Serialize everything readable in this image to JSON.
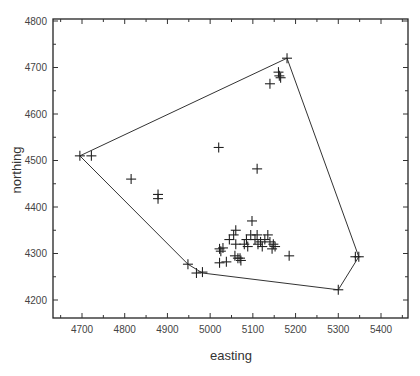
{
  "chart_data": {
    "type": "scatter",
    "title": "",
    "xlabel": "easting",
    "ylabel": "northing",
    "xlim": [
      4640,
      5460
    ],
    "ylim": [
      4150,
      4810
    ],
    "xticks": [
      4700,
      4800,
      4900,
      5000,
      5100,
      5200,
      5300,
      5400
    ],
    "yticks": [
      4200,
      4300,
      4400,
      4500,
      4600,
      4700,
      4800
    ],
    "grid": false,
    "legend": null,
    "marker": "plus",
    "points": [
      [
        4695,
        4510
      ],
      [
        4722,
        4510
      ],
      [
        4815,
        4460
      ],
      [
        4878,
        4427
      ],
      [
        4878,
        4418
      ],
      [
        5020,
        4528
      ],
      [
        5110,
        4482
      ],
      [
        5140,
        4665
      ],
      [
        5160,
        4690
      ],
      [
        5162,
        4682
      ],
      [
        5165,
        4678
      ],
      [
        5180,
        4720
      ],
      [
        4948,
        4277
      ],
      [
        4968,
        4258
      ],
      [
        4982,
        4260
      ],
      [
        5022,
        4310
      ],
      [
        5025,
        4305
      ],
      [
        5030,
        4312
      ],
      [
        5022,
        4280
      ],
      [
        5038,
        4282
      ],
      [
        5045,
        4330
      ],
      [
        5055,
        4340
      ],
      [
        5060,
        4350
      ],
      [
        5060,
        4320
      ],
      [
        5058,
        4295
      ],
      [
        5065,
        4290
      ],
      [
        5070,
        4290
      ],
      [
        5072,
        4285
      ],
      [
        5080,
        4320
      ],
      [
        5085,
        4330
      ],
      [
        5088,
        4315
      ],
      [
        5095,
        4340
      ],
      [
        5098,
        4370
      ],
      [
        5105,
        4330
      ],
      [
        5110,
        4340
      ],
      [
        5112,
        4320
      ],
      [
        5118,
        4325
      ],
      [
        5122,
        4315
      ],
      [
        5128,
        4330
      ],
      [
        5135,
        4340
      ],
      [
        5140,
        4325
      ],
      [
        5145,
        4310
      ],
      [
        5148,
        4320
      ],
      [
        5152,
        4315
      ],
      [
        5185,
        4295
      ],
      [
        5300,
        4222
      ],
      [
        5340,
        4293
      ],
      [
        5348,
        4293
      ]
    ],
    "hull": [
      [
        4695,
        4510
      ],
      [
        5180,
        4720
      ],
      [
        5348,
        4293
      ],
      [
        5300,
        4222
      ],
      [
        4982,
        4258
      ],
      [
        4948,
        4277
      ],
      [
        4695,
        4510
      ]
    ]
  }
}
